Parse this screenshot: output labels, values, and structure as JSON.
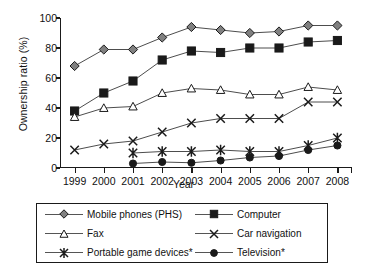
{
  "chart_data": {
    "type": "line",
    "title": "",
    "xlabel": "Year",
    "ylabel": "Ownership ratio (%)",
    "categories": [
      "1999",
      "2000",
      "2001",
      "2002",
      "2003",
      "2004",
      "2005",
      "2006",
      "2007",
      "2008"
    ],
    "ylim": [
      0,
      100
    ],
    "yticks": [
      0,
      20,
      40,
      60,
      80,
      100
    ],
    "xlim_labels": [
      "1999",
      "2008"
    ],
    "grid": false,
    "legend_position": "below-plot",
    "series": [
      {
        "name": "Mobile phones (PHS)",
        "marker": "diamond",
        "fill": "#808080",
        "values": [
          68,
          79,
          79,
          87,
          94,
          92,
          90,
          91,
          95,
          95
        ]
      },
      {
        "name": "Computer",
        "marker": "square",
        "fill": "#1a1a1a",
        "values": [
          38,
          50,
          58,
          72,
          78,
          77,
          80,
          80,
          84,
          85
        ]
      },
      {
        "name": "Fax",
        "marker": "triangle",
        "fill": "#ffffff",
        "values": [
          34,
          40,
          41,
          50,
          53,
          52,
          49,
          49,
          54,
          52
        ]
      },
      {
        "name": "Car navigation",
        "marker": "cross",
        "fill": "#1a1a1a",
        "values": [
          12,
          16,
          18,
          24,
          30,
          33,
          33,
          33,
          44,
          44
        ]
      },
      {
        "name": "Portable game devices*",
        "marker": "asterisk",
        "fill": "#1a1a1a",
        "values": [
          null,
          null,
          10,
          11,
          11,
          12,
          11,
          11,
          15,
          20
        ]
      },
      {
        "name": "Television*",
        "marker": "circle",
        "fill": "#1a1a1a",
        "values": [
          null,
          null,
          3,
          4,
          3.5,
          5,
          7,
          8,
          12,
          15
        ]
      }
    ]
  },
  "legend": {
    "entries": [
      {
        "label": "Mobile phones (PHS)"
      },
      {
        "label": "Computer"
      },
      {
        "label": "Fax"
      },
      {
        "label": "Car navigation"
      },
      {
        "label": "Portable game devices*"
      },
      {
        "label": "Television*"
      }
    ]
  }
}
